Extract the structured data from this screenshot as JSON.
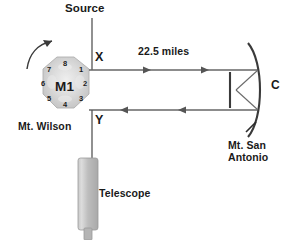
{
  "diagram": {
    "title_text": "Michelson rotating mirror speed of light apparatus",
    "background_color": "#ffffff",
    "line_color": "#4a4a4a",
    "text_color": "#1a1a1a"
  },
  "labels": {
    "source": "Source",
    "distance": "22.5 miles",
    "point_x": "X",
    "point_y": "Y",
    "mirror_c": "C",
    "rotating_mirror": "M1",
    "site_left": "Mt. Wilson",
    "site_right_line1": "Mt. San",
    "site_right_line2": "Antonio",
    "telescope": "Telescope"
  },
  "octagon": {
    "name": "M1",
    "face_count": 8,
    "faces": [
      {
        "number": "1",
        "x": 81,
        "y": 70
      },
      {
        "number": "2",
        "x": 85,
        "y": 84
      },
      {
        "number": "3",
        "x": 81,
        "y": 99
      },
      {
        "number": "4",
        "x": 65,
        "y": 105
      },
      {
        "number": "5",
        "x": 49,
        "y": 99
      },
      {
        "number": "6",
        "x": 43,
        "y": 84
      },
      {
        "number": "7",
        "x": 49,
        "y": 70
      },
      {
        "number": "8",
        "x": 65,
        "y": 64
      }
    ],
    "fill_color": "#d4d4d4",
    "rotation_direction": "clockwise"
  },
  "beams": {
    "outgoing_label": "22.5 miles",
    "outgoing_direction": "right",
    "returning_direction": "left",
    "outgoing_y": 70,
    "returning_y": 110
  },
  "icons": {
    "rotation_arrow": "curved-rotation-arrow-icon",
    "concave_mirror": "concave-mirror-icon",
    "flat_mirror": "flat-mirror-icon",
    "telescope_body": "telescope-icon",
    "arrowhead": "arrowhead-icon"
  }
}
